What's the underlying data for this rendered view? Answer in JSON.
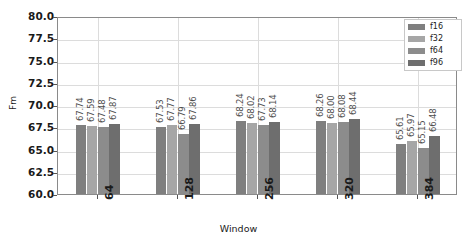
{
  "chart_data": {
    "type": "bar",
    "title": "",
    "xlabel": "Window",
    "ylabel": "Fm",
    "categories": [
      "64",
      "128",
      "256",
      "320",
      "384"
    ],
    "ylim": [
      60.0,
      80.0
    ],
    "ytick_values": [
      "80.0",
      "77.5",
      "75.0",
      "72.5",
      "70.0",
      "67.5",
      "65.0",
      "62.5",
      "60.0"
    ],
    "grid": true,
    "legend_position": "top-right",
    "series": [
      {
        "name": "f16",
        "color": "#7f7f7f",
        "values": [
          67.74,
          67.53,
          68.24,
          68.26,
          65.61
        ]
      },
      {
        "name": "f32",
        "color": "#a6a6a6",
        "values": [
          67.59,
          67.77,
          68.02,
          68.0,
          65.97
        ]
      },
      {
        "name": "f64",
        "color": "#8c8c8c",
        "values": [
          67.48,
          66.79,
          67.73,
          68.08,
          65.15
        ]
      },
      {
        "name": "f96",
        "color": "#6e6e6e",
        "values": [
          67.87,
          67.86,
          68.14,
          68.44,
          66.48
        ]
      }
    ],
    "data_labels": [
      [
        "67.74",
        "67.59",
        "67.48",
        "67.87"
      ],
      [
        "67.53",
        "67.77",
        "66.79",
        "67.86"
      ],
      [
        "68.24",
        "68.02",
        "67.73",
        "68.14"
      ],
      [
        "68.26",
        "68.00",
        "68.08",
        "68.44"
      ],
      [
        "65.61",
        "65.97",
        "65.15",
        "66.48"
      ]
    ]
  },
  "legend": {
    "items": [
      {
        "label": "f16"
      },
      {
        "label": "f32"
      },
      {
        "label": "f64"
      },
      {
        "label": "f96"
      }
    ]
  }
}
